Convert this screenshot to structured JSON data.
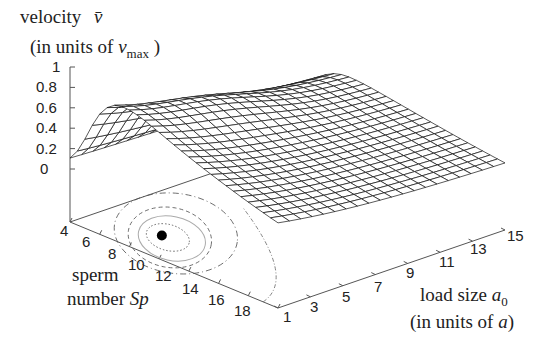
{
  "chart_data": {
    "type": "surface3d",
    "title": "",
    "zlabel": {
      "line1": "velocity",
      "symbol": "v̄",
      "line2_prefix": "(in units of ",
      "line2_var": "v",
      "line2_sub": "max",
      "line2_suffix": " )"
    },
    "ylabel": {
      "line1": "sperm",
      "line2_prefix": "number ",
      "line2_var": "Sp"
    },
    "xlabel": {
      "line1_prefix": "load size ",
      "line1_var": "a",
      "line1_sub": "0",
      "line2_prefix": "(in units of ",
      "line2_var": "a",
      "line2_suffix": ")"
    },
    "z_ticks": [
      "0",
      "0.2",
      "0.4",
      "0.6",
      "0.8",
      "1"
    ],
    "zlim": [
      0,
      1
    ],
    "sp_ticks": [
      "4",
      "6",
      "8",
      "10",
      "12",
      "14",
      "16",
      "18"
    ],
    "a0_ticks": [
      "1",
      "3",
      "5",
      "7",
      "9",
      "11",
      "13",
      "15"
    ],
    "sp_range": [
      4,
      18
    ],
    "a0_range": [
      1,
      15
    ],
    "peak": {
      "Sp": 7,
      "a0": 2,
      "v": 0.82
    },
    "contour_max_marker": {
      "Sp": 8,
      "a0": 3
    }
  }
}
